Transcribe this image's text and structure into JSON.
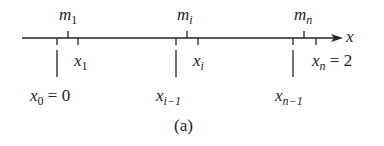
{
  "diagram": {
    "axis_label": "x",
    "caption": "(a)",
    "midpoints": [
      {
        "var": "m",
        "sub": "1"
      },
      {
        "var": "m",
        "sub": "i"
      },
      {
        "var": "m",
        "sub": "n"
      }
    ],
    "partition_points": [
      {
        "var": "x",
        "sub": "0",
        "suffix": " = 0"
      },
      {
        "var": "x",
        "sub": "1",
        "suffix": ""
      },
      {
        "var": "x",
        "sub": "i−1",
        "suffix": ""
      },
      {
        "var": "x",
        "sub": "i",
        "suffix": ""
      },
      {
        "var": "x",
        "sub": "n−1",
        "suffix": ""
      },
      {
        "var": "x",
        "sub": "n",
        "suffix": " = 2"
      }
    ],
    "colors": {
      "line": "#222222",
      "background": "#ffffff"
    }
  }
}
